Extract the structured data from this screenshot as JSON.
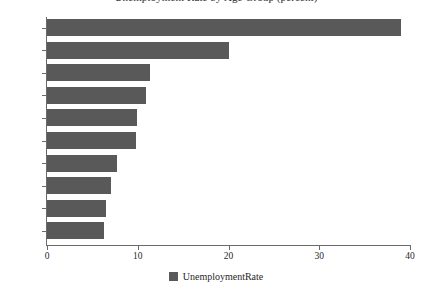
{
  "chart_data": {
    "type": "bar",
    "orientation": "horizontal",
    "title": "Unemployment Rate by Age Group (percent)",
    "xlabel": "",
    "ylabel": "",
    "xlim": [
      0,
      40
    ],
    "xticks": [
      "0",
      "10",
      "20",
      "30",
      "40"
    ],
    "xtick_values": [
      0,
      10,
      20,
      30,
      40
    ],
    "grid": false,
    "legend_position": "bottom-center",
    "bar_color": "#595959",
    "axis_color": "#6a6a6a",
    "categories": [
      "16 - 19",
      "20 - 24",
      "25 - 29",
      "30 - 34",
      "35 - 44",
      "45 - 54",
      "55 - 59",
      "75 +",
      "65 - 74",
      "60 - 64"
    ],
    "series": [
      {
        "name": "UnemploymentRate",
        "values": [
          39.0,
          20.0,
          11.3,
          10.9,
          9.9,
          9.8,
          7.7,
          7.1,
          6.5,
          6.3
        ]
      }
    ]
  },
  "legend": {
    "entries": [
      {
        "label": "UnemploymentRate",
        "color": "#595959",
        "swatch": "legend-swatch-icon"
      }
    ]
  }
}
